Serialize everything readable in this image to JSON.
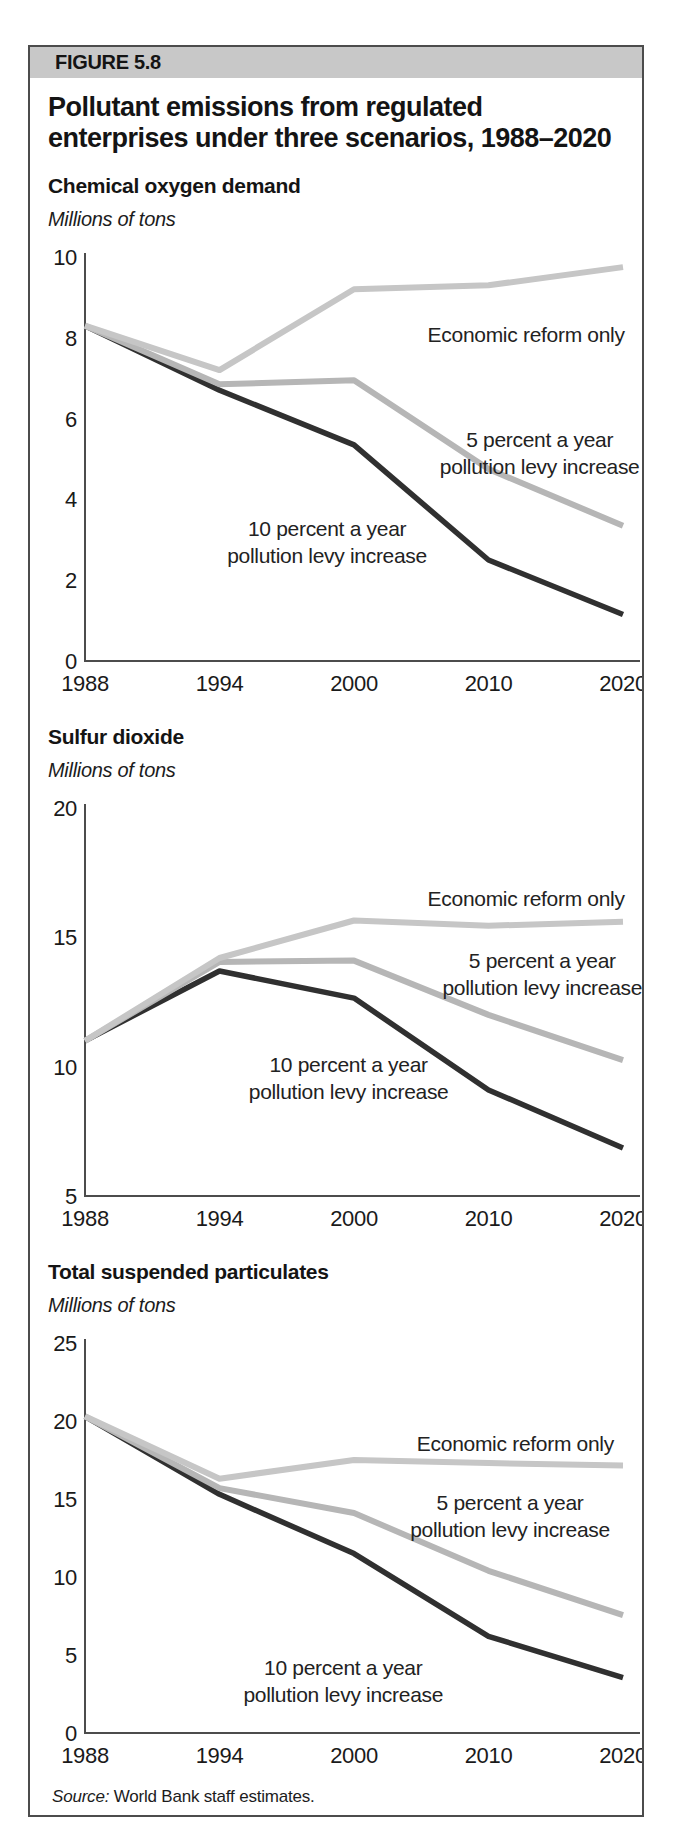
{
  "figure": {
    "label": "FIGURE 5.8",
    "title": "Pollutant emissions from regulated enterprises under three scenarios, 1988–2020",
    "source_prefix": "Source:",
    "source_text": " World Bank staff estimates."
  },
  "colors": {
    "band": "#c8c8c8",
    "border": "#4c4c4c",
    "axis": "#4c4c4c",
    "text": "#141414",
    "reform": "#c6c6c6",
    "five": "#b6b6b6",
    "ten": "#303030"
  },
  "chart_data": [
    {
      "type": "line",
      "heading": "Chemical oxygen demand",
      "unit_label": "Millions of tons",
      "x": [
        "1988",
        "1994",
        "2000",
        "2010",
        "2020"
      ],
      "ylim": [
        0,
        10
      ],
      "yticks": [
        0,
        2,
        4,
        6,
        8,
        10
      ],
      "grid": false,
      "legend": "inline-annotations",
      "series": [
        {
          "name": "Economic reform only",
          "key": "reform",
          "values": [
            8.3,
            7.2,
            9.2,
            9.3,
            9.75
          ]
        },
        {
          "name": "5 percent a year pollution levy increase",
          "key": "five",
          "values": [
            8.3,
            6.85,
            6.95,
            4.75,
            3.35
          ]
        },
        {
          "name": "10 percent a year pollution levy increase",
          "key": "ten",
          "values": [
            8.3,
            6.7,
            5.35,
            2.5,
            1.15
          ]
        }
      ],
      "annotations": [
        {
          "series": "reform",
          "lines": [
            "Economic reform only"
          ],
          "fx": 0.82,
          "val": 7.9
        },
        {
          "series": "five",
          "lines": [
            "5 percent a year",
            "pollution levy increase"
          ],
          "fx": 0.845,
          "val": 5.3
        },
        {
          "series": "ten",
          "lines": [
            "10 percent a year",
            "pollution levy increase"
          ],
          "fx": 0.45,
          "val": 3.1
        }
      ]
    },
    {
      "type": "line",
      "heading": "Sulfur dioxide",
      "unit_label": "Millions of tons",
      "x": [
        "1988",
        "1994",
        "2000",
        "2010",
        "2020"
      ],
      "ylim": [
        5,
        20
      ],
      "yticks": [
        5,
        10,
        15,
        20
      ],
      "grid": false,
      "legend": "inline-annotations",
      "series": [
        {
          "name": "Economic reform only",
          "key": "reform",
          "values": [
            11,
            14.2,
            15.65,
            15.45,
            15.6
          ]
        },
        {
          "name": "5 percent a year pollution levy increase",
          "key": "five",
          "values": [
            11,
            14.05,
            14.1,
            12.0,
            10.25
          ]
        },
        {
          "name": "10 percent a year pollution levy increase",
          "key": "ten",
          "values": [
            11,
            13.7,
            12.65,
            9.1,
            6.85
          ]
        }
      ],
      "annotations": [
        {
          "series": "reform",
          "lines": [
            "Economic reform only"
          ],
          "fx": 0.82,
          "val": 16.2
        },
        {
          "series": "five",
          "lines": [
            "5 percent a year",
            "pollution levy increase"
          ],
          "fx": 0.85,
          "val": 13.8
        },
        {
          "series": "ten",
          "lines": [
            "10 percent a year",
            "pollution levy increase"
          ],
          "fx": 0.49,
          "val": 9.8
        }
      ]
    },
    {
      "type": "line",
      "heading": "Total suspended particulates",
      "unit_label": "Millions of tons",
      "x": [
        "1988",
        "1994",
        "2000",
        "2010",
        "2020"
      ],
      "ylim": [
        0,
        25
      ],
      "yticks": [
        0,
        5,
        10,
        15,
        20,
        25
      ],
      "grid": false,
      "legend": "inline-annotations",
      "series": [
        {
          "name": "Economic reform only",
          "key": "reform",
          "values": [
            20.3,
            16.3,
            17.5,
            17.3,
            17.15
          ]
        },
        {
          "name": "5 percent a year pollution levy increase",
          "key": "five",
          "values": [
            20.3,
            15.7,
            14.1,
            10.4,
            7.55
          ]
        },
        {
          "name": "10 percent a year pollution levy increase",
          "key": "ten",
          "values": [
            20.3,
            15.3,
            11.5,
            6.2,
            3.55
          ]
        }
      ],
      "annotations": [
        {
          "series": "reform",
          "lines": [
            "Economic reform only"
          ],
          "fx": 0.8,
          "val": 18.1
        },
        {
          "series": "five",
          "lines": [
            "5 percent a year",
            "pollution levy increase"
          ],
          "fx": 0.79,
          "val": 14.3
        },
        {
          "series": "ten",
          "lines": [
            "10 percent a year",
            "pollution levy increase"
          ],
          "fx": 0.48,
          "val": 3.7
        }
      ]
    }
  ]
}
